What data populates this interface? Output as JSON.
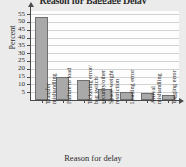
{
  "chart_data": {
    "type": "bar",
    "title": "Reason for Baggage Delay",
    "xlabel": "Reason for delay",
    "ylabel": "Percent",
    "categories": [
      "Transfer mishandling",
      "Failure to load",
      "Ticketing error/ bag switch/ security/other",
      "Space-weight restriction",
      "Loading error",
      "Arrival mishandling",
      "Tagging error"
    ],
    "category_lines": [
      [
        "Transfer",
        "mishandling"
      ],
      [
        "Failure to load"
      ],
      [
        "Ticketing error/",
        "bag switch/",
        "security/other"
      ],
      [
        "Space-weight",
        "restriction"
      ],
      [
        "Loading error"
      ],
      [
        "Arrival",
        "mishandling"
      ],
      [
        "Tagging error"
      ]
    ],
    "values": [
      53,
      15,
      13,
      7,
      5,
      4.5,
      3
    ],
    "ylim": [
      0,
      57
    ],
    "yticks": [
      5,
      10,
      15,
      20,
      25,
      30,
      35,
      40,
      45,
      50,
      55
    ],
    "grid": true,
    "legend": "none",
    "bar_color": "#a9a9a9",
    "bar_edge_color": "#6f6f6f",
    "axis_color": "#4a4a4a",
    "grid_color": "#d2d2d2",
    "plot_background": "#fdfdfd",
    "page_background": "#ebebeb"
  }
}
